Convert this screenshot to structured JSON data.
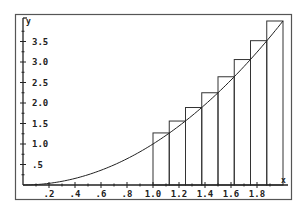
{
  "chart_data": {
    "type": "bar",
    "subtype": "riemann-sum-right-endpoint",
    "title": "",
    "xlabel": "x",
    "ylabel": "y",
    "xlim": [
      0,
      2.0
    ],
    "ylim": [
      0,
      4.0
    ],
    "grid": false,
    "legend": null,
    "x_ticks": [
      ".2",
      ".4",
      ".6",
      ".8",
      "1.0",
      "1.2",
      "1.4",
      "1.6",
      "1.8"
    ],
    "x_tick_values": [
      0.2,
      0.4,
      0.6,
      0.8,
      1.0,
      1.2,
      1.4,
      1.6,
      1.8
    ],
    "y_ticks": [
      ".5",
      "1.0",
      "1.5",
      "2.0",
      "2.5",
      "3.0",
      "3.5"
    ],
    "y_tick_values": [
      0.5,
      1.0,
      1.5,
      2.0,
      2.5,
      3.0,
      3.5
    ],
    "curve": {
      "label": "y = x^2",
      "x_range": [
        0,
        2.0
      ]
    },
    "bars": {
      "bin_width": 0.125,
      "left_edges": [
        1.0,
        1.125,
        1.25,
        1.375,
        1.5,
        1.625,
        1.75,
        1.875
      ],
      "heights": [
        1.27,
        1.56,
        1.89,
        2.25,
        2.64,
        3.06,
        3.52,
        4.0
      ]
    }
  }
}
